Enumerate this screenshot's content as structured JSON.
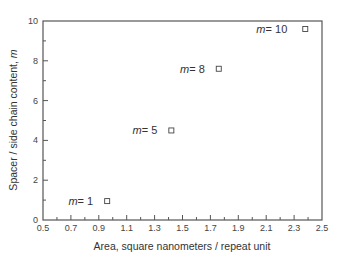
{
  "chart_data": {
    "type": "scatter",
    "title": "",
    "xlabel": "Area, square nanometers / repeat unit",
    "ylabel": "Spacer / side chain content, m",
    "xlim": [
      0.5,
      2.5
    ],
    "ylim": [
      0,
      10
    ],
    "x_ticks": [
      "0.5",
      "0.7",
      "0.9",
      "1.1",
      "1.3",
      "1.5",
      "1.7",
      "1.9",
      "2.1",
      "2.3",
      "2.5"
    ],
    "y_ticks": [
      "0",
      "2",
      "4",
      "6",
      "8",
      "10"
    ],
    "grid": false,
    "legend": null,
    "marker": "open-square",
    "series": [
      {
        "name": "data",
        "points": [
          {
            "x": 0.96,
            "y": 0.95,
            "label": "m = 1"
          },
          {
            "x": 1.42,
            "y": 4.5,
            "label": "m = 5"
          },
          {
            "x": 1.76,
            "y": 7.6,
            "label": "m = 8"
          },
          {
            "x": 2.38,
            "y": 9.6,
            "label": "m = 10"
          }
        ]
      }
    ],
    "annotations": [
      {
        "text": "m = 1",
        "m": "m",
        "value": "= 1"
      },
      {
        "text": "m = 5",
        "m": "m",
        "value": "= 5"
      },
      {
        "text": "m = 8",
        "m": "m",
        "value": "= 8"
      },
      {
        "text": "m = 10",
        "m": "m",
        "value": "= 10"
      }
    ]
  }
}
